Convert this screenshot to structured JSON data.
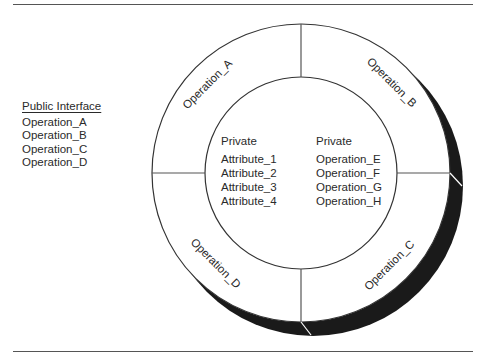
{
  "public_interface": {
    "title": "Public Interface",
    "items": [
      "Operation_A",
      "Operation_B",
      "Operation_C",
      "Operation_D"
    ]
  },
  "ring": {
    "segments": [
      {
        "label": "Operation_A",
        "position": "upper-left"
      },
      {
        "label": "Operation_B",
        "position": "upper-right"
      },
      {
        "label": "Operation_C",
        "position": "lower-right"
      },
      {
        "label": "Operation_D",
        "position": "lower-left"
      }
    ]
  },
  "core": {
    "left": {
      "heading": "Private",
      "items": [
        "Attribute_1",
        "Attribute_2",
        "Attribute_3",
        "Attribute_4"
      ]
    },
    "right": {
      "heading": "Private",
      "items": [
        "Operation_E",
        "Operation_F",
        "Operation_G",
        "Operation_H"
      ]
    }
  },
  "colors": {
    "line": "#333333",
    "shadow": "#1a1a1a",
    "background": "#ffffff"
  }
}
